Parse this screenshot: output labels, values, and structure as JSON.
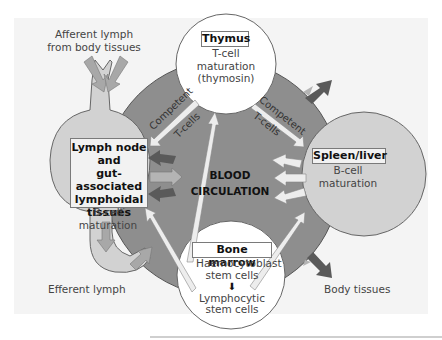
{
  "diagram": {
    "colors": {
      "blood_ring": "#8e8e8e",
      "organ_fill": "#d2d2d2",
      "white_circle": "#ffffff",
      "dark_arrow": "#5a5a5a",
      "light_arrow": "#ededed",
      "medium_arrow": "#a8a8a8"
    },
    "center": {
      "line1": "BLOOD",
      "line2": "CIRCULATION"
    },
    "thymus": {
      "title": "Thymus",
      "line1": "T-cell",
      "line2": "maturation",
      "line3": "(thymosin)"
    },
    "lymph_node": {
      "title_line1": "Lymph node",
      "title_line2": "and",
      "title_line3": "gut-associated",
      "title_line4": "lymphoidal",
      "title_line5": "tissues",
      "sub_line1": "B-cell",
      "sub_line2": "maturation"
    },
    "spleen": {
      "title": "Spleen/liver",
      "line1": "B-cell",
      "line2": "maturation"
    },
    "bone_marrow": {
      "title": "Bone marrow",
      "line1": "Haemocytoblast",
      "line2": "stem cells",
      "arrow": "⬇",
      "line3": "Lymphocytic",
      "line4": "stem cells"
    },
    "labels": {
      "afferent_line1": "Afferent lymph",
      "afferent_line2": "from body tissues",
      "efferent": "Efferent lymph",
      "body_tissues": "Body tissues",
      "competent_left_1": "Competent",
      "competent_left_2": "T-cells",
      "competent_right_1": "Competent",
      "competent_right_2": "T-cells"
    }
  }
}
